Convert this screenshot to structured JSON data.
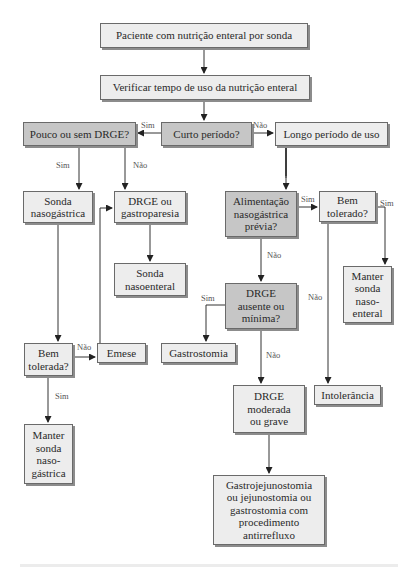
{
  "diagram": {
    "type": "flowchart",
    "colors": {
      "light_box": "#ededed",
      "dark_box": "#c6c6c6",
      "border": "#6a6a6a",
      "line": "#333333",
      "text": "#2a2a2a"
    },
    "nodes": {
      "n1": {
        "text": "Paciente com nutrição enteral por sonda"
      },
      "n2": {
        "text": "Verificar tempo de uso da nutrição enteral"
      },
      "n3": {
        "text": "Curto período?"
      },
      "n4": {
        "text": "Pouco ou sem DRGE?"
      },
      "n5": {
        "text": "Longo período de uso"
      },
      "n6": {
        "text": "Sonda\nnasogástrica"
      },
      "n7": {
        "text": "DRGE ou\ngastroparesia"
      },
      "n8": {
        "text": "Sonda\nnasoenteral"
      },
      "n9": {
        "text": "Alimentação\nnasogástrica\nprévia?"
      },
      "n10": {
        "text": "Bem\ntolerado?"
      },
      "n11": {
        "text": "Manter\nsonda\nnaso-\nenteral"
      },
      "n12": {
        "text": "DRGE\nausente ou\nmínima?"
      },
      "n13": {
        "text": "Gastrostomia"
      },
      "n14": {
        "text": "Bem\ntolerada?"
      },
      "n15": {
        "text": "Emese"
      },
      "n16": {
        "text": "DRGE\nmoderada\nou grave"
      },
      "n17": {
        "text": "Intolerância"
      },
      "n18": {
        "text": "Manter\nsonda\nnaso-\ngástrica"
      },
      "n19": {
        "text": "Gastrojejunostomia\nou jejunostomia ou\ngastrostomia com\nprocedimento\nantirrefluxo"
      }
    },
    "edge_labels": {
      "curto_sim": "Sim",
      "curto_nao": "Não",
      "pouco_sim": "Sim",
      "pouco_nao": "Não",
      "alim_sim": "Sim",
      "alim_nao": "Não",
      "bemtolerado_sim": "Sim",
      "bemtolerado_nao": "Não",
      "drge_sim": "Sim",
      "drge_nao": "Não",
      "bemtolerada_nao": "Não",
      "bemtolerada_sim": "Sim"
    }
  }
}
